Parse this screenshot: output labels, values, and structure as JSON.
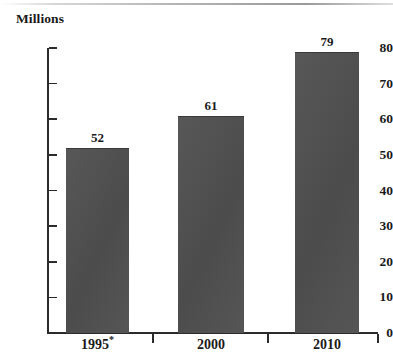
{
  "chart_data": {
    "type": "bar",
    "title": "",
    "subtitle": "",
    "xlabel": "",
    "ylabel": "Millions",
    "categories": [
      "1995*",
      "2000",
      "2010"
    ],
    "values": [
      52,
      61,
      79
    ],
    "value_labels": [
      "52",
      "61",
      "79"
    ],
    "ylim": [
      0,
      80
    ],
    "y_ticks": [
      "0",
      "10",
      "20",
      "30",
      "40",
      "50",
      "60",
      "70",
      "80"
    ],
    "y_tick_values": [
      0,
      10,
      20,
      30,
      40,
      50,
      60,
      70,
      80
    ],
    "grid": false,
    "legend": false,
    "legend_position": "none",
    "series": [
      {
        "name": "",
        "values": [
          52,
          61,
          79
        ],
        "color": "#505050"
      }
    ],
    "annotations": [
      {
        "text": "*",
        "note": "asterisk footnote marker on the 1995 category label"
      }
    ],
    "colors": {
      "bar_fill": "#505050",
      "axis": "#2b2b2b",
      "text": "#1a1a1a",
      "background": "#ffffff"
    }
  },
  "axis": {
    "y_title": "Millions"
  }
}
